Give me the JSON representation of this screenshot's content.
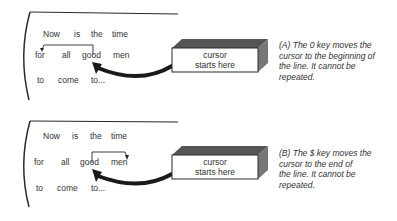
{
  "panels": [
    {
      "id": "A",
      "lines": [
        [
          "Now",
          "is",
          "the",
          "time"
        ],
        [
          "for",
          "all",
          "good",
          "men"
        ],
        [
          "to",
          "come",
          "to..."
        ]
      ],
      "box_label_line1": "cursor",
      "box_label_line2": "starts here",
      "caption": "(A) The 0 key moves the cursor to the beginning of the line. It cannot be repeated.",
      "caption_lines": [
        "(A) The 0 key moves the",
        "cursor to the beginning of",
        "the line. It cannot be",
        "repeated."
      ],
      "bracket_direction": "left-to-line-start"
    },
    {
      "id": "B",
      "lines": [
        [
          "Now",
          "is",
          "the",
          "time"
        ],
        [
          "for",
          "all",
          "good",
          "men"
        ],
        [
          "to",
          "come",
          "to..."
        ]
      ],
      "box_label_line1": "cursor",
      "box_label_line2": "starts here",
      "caption": "(B) The $ key moves the cursor to the end of the line. It cannot be repeated.",
      "caption_lines": [
        "(B) The $ key moves the",
        "cursor to the end of",
        "the line. It cannot be",
        "repeated."
      ],
      "bracket_direction": "right-to-line-end"
    }
  ],
  "colors": {
    "ink": "#2a2a2a",
    "box_top": "#555555",
    "box_side": "#777777",
    "box_face": "#ffffff"
  }
}
